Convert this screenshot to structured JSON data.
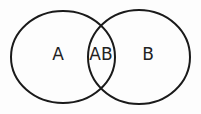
{
  "diagram": {
    "type": "venn",
    "sets": [
      {
        "label": "A",
        "cx": 63,
        "cy": 57,
        "rx": 52,
        "ry": 46
      },
      {
        "label": "B",
        "cx": 139,
        "cy": 57,
        "rx": 51,
        "ry": 47
      }
    ],
    "regions": [
      {
        "label": "A",
        "x": 58,
        "y": 60
      },
      {
        "label": "AB",
        "x": 101,
        "y": 60
      },
      {
        "label": "B",
        "x": 148,
        "y": 60
      }
    ],
    "stroke_color": "#1a1a1a",
    "background": "#fdfdfd"
  }
}
